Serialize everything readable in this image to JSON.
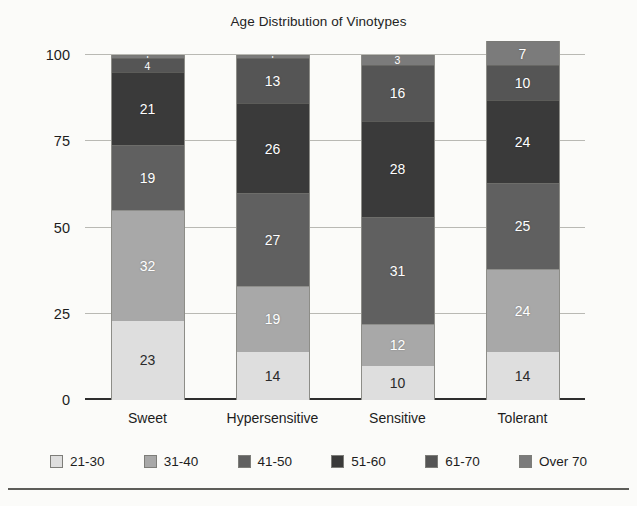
{
  "chart_data": {
    "type": "bar",
    "subtype": "stacked-bar",
    "title": "Age Distribution of Vinotypes",
    "xlabel": "",
    "ylabel": "",
    "ylim": [
      0,
      100
    ],
    "yticks": [
      0,
      25,
      50,
      75,
      100
    ],
    "grid": true,
    "legend_position": "bottom",
    "categories": [
      "Sweet",
      "Hypersensitive",
      "Sensitive",
      "Tolerant"
    ],
    "series": [
      {
        "name": "21-30",
        "color": "#dedede",
        "text_color": "#2a2a2a",
        "values": [
          23,
          14,
          10,
          14
        ]
      },
      {
        "name": "31-40",
        "color": "#a8a8a8",
        "text_color": "#ffffff",
        "values": [
          32,
          19,
          12,
          24
        ]
      },
      {
        "name": "41-50",
        "color": "#606060",
        "text_color": "#ffffff",
        "values": [
          19,
          27,
          31,
          25
        ]
      },
      {
        "name": "51-60",
        "color": "#3a3a3a",
        "text_color": "#ffffff",
        "values": [
          21,
          26,
          28,
          24
        ]
      },
      {
        "name": "61-70",
        "color": "#555555",
        "text_color": "#ffffff",
        "values": [
          4,
          13,
          16,
          10
        ]
      },
      {
        "name": "Over 70",
        "color": "#7b7b7b",
        "text_color": "#ffffff",
        "values": [
          1,
          1,
          3,
          7
        ]
      }
    ]
  },
  "legend": {
    "items": [
      {
        "label": "21-30"
      },
      {
        "label": "31-40"
      },
      {
        "label": "41-50"
      },
      {
        "label": "51-60"
      },
      {
        "label": "61-70"
      },
      {
        "label": "Over 70"
      }
    ]
  },
  "axes": {
    "y_tick_labels": [
      "0",
      "25",
      "50",
      "75",
      "100"
    ],
    "x_tick_labels": [
      "Sweet",
      "Hypersensitive",
      "Sensitive",
      "Tolerant"
    ]
  }
}
